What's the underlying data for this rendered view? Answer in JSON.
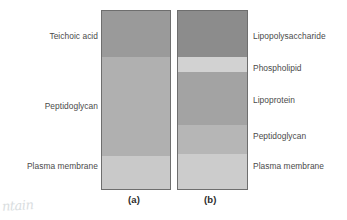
{
  "figure": {
    "type": "bacterial-cell-wall-comparison-diagram",
    "background_color": "#ffffff",
    "outline_color": "#6e6e6e",
    "text_color": "#4a4a4a"
  },
  "columns": [
    {
      "id": "a",
      "caption": "(a)",
      "label_side": "left",
      "bands": [
        {
          "label": "Teichoic acid",
          "color": "#9a9a9a",
          "height_pct": 26.1
        },
        {
          "label": "Peptidoglycan",
          "color": "#b0b0b0",
          "height_pct": 55.6
        },
        {
          "label": "Plasma membrane",
          "color": "#c9c9c9",
          "height_pct": 18.3
        }
      ]
    },
    {
      "id": "b",
      "caption": "(b)",
      "label_side": "right",
      "bands": [
        {
          "label": "Lipopolysaccharide",
          "color": "#8c8c8c",
          "height_pct": 26.1
        },
        {
          "label": "Phospholipid",
          "color": "#d2d2d2",
          "height_pct": 8.3
        },
        {
          "label": "Lipoprotein",
          "color": "#a3a3a3",
          "height_pct": 29.5
        },
        {
          "label": "Peptidoglycan",
          "color": "#b6b6b6",
          "height_pct": 16.7
        },
        {
          "label": "Plasma membrane",
          "color": "#cccccc",
          "height_pct": 19.4
        }
      ]
    }
  ],
  "labels": {
    "left": [
      {
        "text": "Teichoic acid",
        "top": 31
      },
      {
        "text": "Peptidoglycan",
        "top": 101
      },
      {
        "text": "Plasma membrane",
        "top": 161
      }
    ],
    "right": [
      {
        "text": "Lipopolysaccharide",
        "top": 31
      },
      {
        "text": "Phospholipid",
        "top": 63
      },
      {
        "text": "Lipoprotein",
        "top": 95
      },
      {
        "text": "Peptidoglycan",
        "top": 131
      },
      {
        "text": "Plasma membrane",
        "top": 161
      }
    ]
  },
  "artifact": {
    "handwriting": "ntain"
  }
}
